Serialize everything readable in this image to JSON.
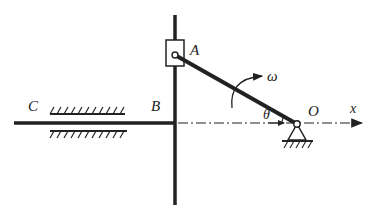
{
  "diagram": {
    "type": "mechanism",
    "labels": {
      "A": "A",
      "B": "B",
      "C": "C",
      "O": "O",
      "x": "x",
      "omega": "ω",
      "theta": "θ"
    },
    "colors": {
      "ink": "#222222",
      "background": "#ffffff"
    }
  }
}
